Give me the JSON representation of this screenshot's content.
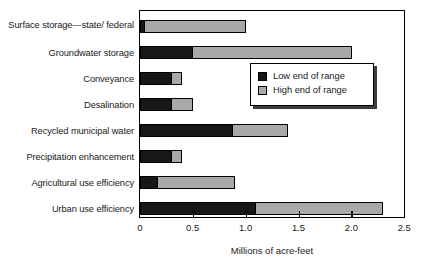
{
  "chart_data": {
    "type": "bar",
    "orientation": "horizontal",
    "stacked": true,
    "title": "",
    "xlabel": "Millions of acre-feet",
    "ylabel": "",
    "xlim": [
      0,
      2.5
    ],
    "xticks": [
      0,
      0.5,
      1.0,
      1.5,
      2.0,
      2.5
    ],
    "xticklabels": [
      "0",
      "0.5",
      "1.0",
      "1.5",
      "2.0",
      "2.5"
    ],
    "grid": false,
    "legend_position": "upper right",
    "categories": [
      "Surface storage—state/ federal",
      "Groundwater storage",
      "Conveyance",
      "Desalination",
      "Recycled municipal water",
      "Precipitation enhancement",
      "Agricultural use efficiency",
      "Urban use efficiency"
    ],
    "series": [
      {
        "name": "Low end of range",
        "color": "#171717",
        "values": [
          0.05,
          0.5,
          0.3,
          0.3,
          0.88,
          0.3,
          0.17,
          1.1
        ]
      },
      {
        "name": "High end of range",
        "color": "#a9a9a9",
        "values": [
          1.0,
          2.0,
          0.4,
          0.5,
          1.4,
          0.4,
          0.9,
          2.3
        ]
      }
    ]
  },
  "legend": {
    "entries": [
      {
        "label": "Low end of range",
        "swatch": "low"
      },
      {
        "label": "High end of range",
        "swatch": "high"
      }
    ]
  },
  "axis": {
    "x_title": "Millions of acre-feet"
  }
}
